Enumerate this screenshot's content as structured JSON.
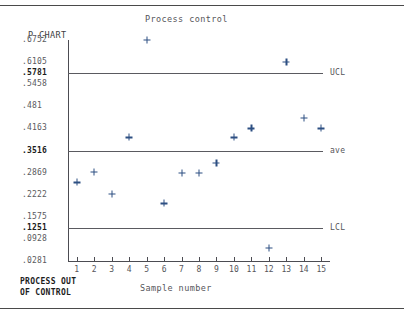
{
  "page": {
    "background": "#ffffff"
  },
  "chart_data": {
    "type": "scatter",
    "title": "Process control",
    "subtitle": "P CHART",
    "xlabel": "Sample number",
    "ylabel": "",
    "categories": [
      "1",
      "2",
      "3",
      "4",
      "5",
      "6",
      "7",
      "8",
      "9",
      "10",
      "11",
      "12",
      "13",
      "14",
      "15"
    ],
    "x": [
      1,
      2,
      3,
      4,
      5,
      6,
      7,
      8,
      9,
      10,
      11,
      12,
      13,
      14,
      15
    ],
    "values": [
      0.2584,
      0.2889,
      0.2255,
      0.3899,
      0.6752,
      0.1969,
      0.2869,
      0.2869,
      0.3155,
      0.3899,
      0.4163,
      0.0655,
      0.6105,
      0.4481,
      0.4163
    ],
    "ylim": [
      0.0281,
      0.6752
    ],
    "xlim": [
      0.5,
      15.5
    ],
    "grid": false,
    "legend": "none",
    "marker": "plus",
    "marker_color": "#2d4f82",
    "ytick_labels": [
      ".6752",
      ".6105",
      ".5781",
      ".5458",
      ".481",
      ".4163",
      ".3516",
      ".2869",
      ".2222",
      ".1575",
      ".1251",
      ".0928",
      ".0281"
    ],
    "ytick_values": [
      0.6752,
      0.6105,
      0.5781,
      0.5458,
      0.481,
      0.4163,
      0.3516,
      0.2869,
      0.2222,
      0.1575,
      0.1251,
      0.0928,
      0.0281
    ],
    "reference_lines": [
      {
        "name": "UCL",
        "label": "UCL",
        "value": 0.5781,
        "value_label": ".5781"
      },
      {
        "name": "ave",
        "label": "ave",
        "value": 0.3516,
        "value_label": ".3516"
      },
      {
        "name": "LCL",
        "label": "LCL",
        "value": 0.1251,
        "value_label": ".1251"
      }
    ],
    "annotations": [
      "PROCESS OUT",
      "OF CONTROL"
    ]
  },
  "status": {
    "line1": "PROCESS OUT",
    "line2": "OF CONTROL"
  }
}
